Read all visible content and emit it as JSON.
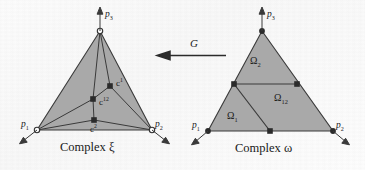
{
  "figure": {
    "kind": "mathematical-diagram",
    "background_color": "#fdfdfd",
    "fill_color": "#a8a8a8",
    "stroke_color": "#3a3a3a"
  },
  "mapping": {
    "label": "G",
    "direction": "right-to-left",
    "arrow_name": "leftward-arrow"
  },
  "left_complex": {
    "caption": "Complex ξ",
    "caption_symbol": "ξ",
    "vertices": [
      {
        "id": "p1",
        "label": "p",
        "sub": "1",
        "marker": "open-circle",
        "x": 37,
        "y": 130
      },
      {
        "id": "p2",
        "label": "p",
        "sub": "2",
        "marker": "open-circle",
        "x": 152,
        "y": 130
      },
      {
        "id": "p3",
        "label": "p",
        "sub": "3",
        "marker": "open-circle",
        "x": 100,
        "y": 31
      }
    ],
    "interior_nodes": [
      {
        "id": "c1",
        "label": "c",
        "sup": "1",
        "marker": "filled-square",
        "x": 110,
        "y": 86
      },
      {
        "id": "c12",
        "label": "c",
        "sup": "12",
        "marker": "filled-square",
        "x": 93,
        "y": 99
      },
      {
        "id": "c2",
        "label": "c",
        "sup": "2",
        "marker": "filled-square",
        "x": 94,
        "y": 120
      }
    ]
  },
  "right_complex": {
    "caption": "Complex ω",
    "caption_symbol": "ω",
    "vertices": [
      {
        "id": "p1",
        "label": "p",
        "sub": "1",
        "marker": "filled-circle",
        "x": 208,
        "y": 131
      },
      {
        "id": "p2",
        "label": "p",
        "sub": "2",
        "marker": "filled-circle",
        "x": 333,
        "y": 131
      },
      {
        "id": "p3",
        "label": "p",
        "sub": "3",
        "marker": "filled-circle",
        "x": 262,
        "y": 31
      }
    ],
    "midpoints": [
      {
        "id": "m13",
        "marker": "filled-square",
        "x": 234,
        "y": 84
      },
      {
        "id": "m23",
        "marker": "filled-square",
        "x": 297,
        "y": 84
      },
      {
        "id": "m12",
        "marker": "filled-square",
        "x": 270,
        "y": 131
      }
    ],
    "regions": [
      {
        "id": "omega2",
        "label": "Ω",
        "sub": "2",
        "x": 257,
        "y": 62
      },
      {
        "id": "omega12",
        "label": "Ω",
        "sub": "12",
        "x": 286,
        "y": 99
      },
      {
        "id": "omega1",
        "label": "Ω",
        "sub": "1",
        "x": 234,
        "y": 117
      }
    ]
  }
}
